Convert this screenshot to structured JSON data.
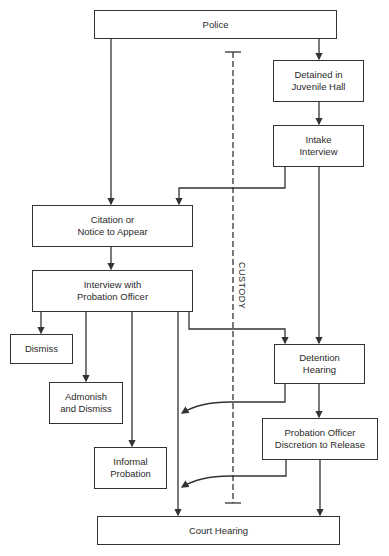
{
  "diagram": {
    "nodes": {
      "police": "Police",
      "detained": "Detained in\nJuvenile Hall",
      "intake": "Intake\nInterview",
      "citation": "Citation or\nNotice to Appear",
      "interview": "Interview with\nProbation Officer",
      "dismiss": "Dismiss",
      "admonish": "Admonish\nand Dismiss",
      "informal": "Informal\nProbation",
      "detention": "Detention\nHearing",
      "discretion": "Probation Officer\nDiscretion to Release",
      "court": "Court Hearing"
    },
    "custody_label": "CUSTODY",
    "edges": [
      [
        "Police",
        "Detained in Juvenile Hall"
      ],
      [
        "Police",
        "Citation or Notice to Appear"
      ],
      [
        "Detained in Juvenile Hall",
        "Intake Interview"
      ],
      [
        "Intake Interview",
        "Citation or Notice to Appear"
      ],
      [
        "Intake Interview",
        "Detention Hearing"
      ],
      [
        "Citation or Notice to Appear",
        "Interview with Probation Officer"
      ],
      [
        "Interview with Probation Officer",
        "Dismiss"
      ],
      [
        "Interview with Probation Officer",
        "Admonish and Dismiss"
      ],
      [
        "Interview with Probation Officer",
        "Informal Probation"
      ],
      [
        "Interview with Probation Officer",
        "Court Hearing"
      ],
      [
        "Interview with Probation Officer",
        "Detention Hearing"
      ],
      [
        "Detention Hearing",
        "Probation Officer Discretion to Release"
      ],
      [
        "Detention Hearing",
        "Court Hearing"
      ],
      [
        "Probation Officer Discretion to Release",
        "Court Hearing"
      ]
    ]
  }
}
